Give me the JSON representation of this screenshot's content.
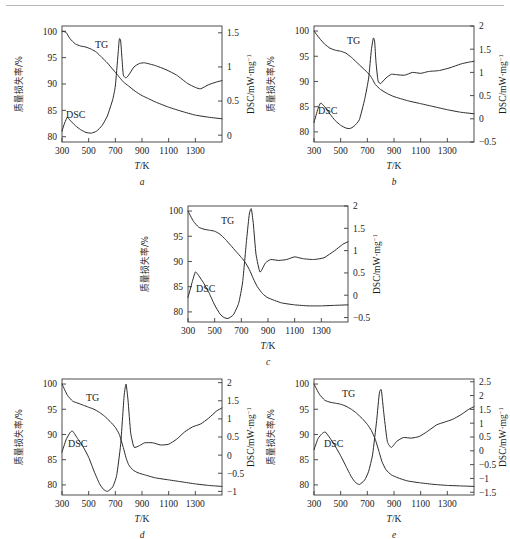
{
  "figure": {
    "axis_titles": {
      "x": "T/K",
      "y_left": "质量损失率/%",
      "y_right": "DSC/mW·mg⁻¹"
    },
    "x_ticks": [
      "300",
      "500",
      "700",
      "900",
      "1100",
      "1300"
    ],
    "y_left_ticks": [
      "80",
      "85",
      "90",
      "95",
      "100"
    ],
    "curve_labels": {
      "tg": "TG",
      "dsc": "DSC"
    }
  },
  "panels": [
    {
      "letter": "a",
      "right_ticks": [
        "0",
        "0.5",
        "1.0",
        "1.5"
      ],
      "tg_label": "TG",
      "dsc_label": "DSC"
    },
    {
      "letter": "b",
      "right_ticks": [
        "-0.5",
        "0",
        "0.5",
        "1.0",
        "1.5",
        "2.0"
      ],
      "tg_label": "TG",
      "dsc_label": "DSC"
    },
    {
      "letter": "c",
      "right_ticks": [
        "-0.5",
        "0",
        "0.5",
        "1.0",
        "1.5",
        "2.0"
      ],
      "tg_label": "TG",
      "dsc_label": "DSC"
    },
    {
      "letter": "d",
      "right_ticks": [
        "-1.0",
        "-0.5",
        "0",
        "0.5",
        "1.0",
        "1.5",
        "2.0"
      ],
      "tg_label": "TG",
      "dsc_label": "DSC"
    },
    {
      "letter": "e",
      "right_ticks": [
        "-1.5",
        "-1.0",
        "-0.5",
        "0",
        "0.5",
        "1.0",
        "1.5",
        "2.0",
        "2.5"
      ],
      "tg_label": "TG",
      "dsc_label": "DSC"
    }
  ],
  "chart_data": [
    {
      "type": "line",
      "title": "a",
      "xlabel": "T/K",
      "ylabel": "质量损失率/%",
      "y2label": "DSC/mW·mg⁻¹",
      "xlim": [
        300,
        1500
      ],
      "ylim": [
        79,
        101
      ],
      "y2lim": [
        -0.1,
        1.6
      ],
      "xticks": [
        300,
        500,
        700,
        900,
        1100,
        1300
      ],
      "yticks": [
        80,
        85,
        90,
        95,
        100
      ],
      "y2ticks": [
        0,
        0.5,
        1.0,
        1.5
      ],
      "grid": false,
      "series": [
        {
          "name": "TG",
          "axis": "left",
          "x": [
            300,
            330,
            360,
            400,
            440,
            480,
            520,
            560,
            600,
            640,
            680,
            700,
            720,
            740,
            760,
            800,
            850,
            900,
            950,
            1000,
            1100,
            1200,
            1300,
            1400,
            1500
          ],
          "values": [
            100.0,
            99.8,
            98.6,
            97.6,
            97.2,
            97.0,
            96.6,
            96.0,
            95.0,
            94.0,
            92.8,
            92.2,
            91.6,
            91.0,
            90.4,
            89.6,
            88.6,
            87.8,
            87.2,
            86.6,
            85.6,
            84.8,
            84.1,
            83.7,
            83.4
          ]
        },
        {
          "name": "DSC",
          "axis": "right",
          "x": [
            300,
            320,
            340,
            360,
            400,
            440,
            480,
            520,
            560,
            600,
            640,
            680,
            700,
            720,
            730,
            740,
            750,
            760,
            780,
            800,
            840,
            880,
            920,
            1000,
            1080,
            1160,
            1240,
            1300,
            1340,
            1400,
            1460,
            1500
          ],
          "values": [
            0.06,
            0.18,
            0.26,
            0.22,
            0.14,
            0.08,
            0.04,
            0.03,
            0.06,
            0.14,
            0.28,
            0.52,
            0.72,
            1.18,
            1.41,
            1.38,
            1.12,
            0.88,
            0.84,
            0.88,
            1.0,
            1.05,
            1.06,
            1.02,
            0.96,
            0.88,
            0.76,
            0.7,
            0.68,
            0.74,
            0.78,
            0.8
          ]
        }
      ]
    },
    {
      "type": "line",
      "title": "b",
      "xlabel": "T/K",
      "ylabel": "质量损失率/%",
      "y2label": "DSC/mW·mg⁻¹",
      "xlim": [
        300,
        1500
      ],
      "ylim": [
        78,
        101
      ],
      "y2lim": [
        -0.5,
        2.0
      ],
      "xticks": [
        300,
        500,
        700,
        900,
        1100,
        1300
      ],
      "yticks": [
        80,
        85,
        90,
        95,
        100
      ],
      "y2ticks": [
        -0.5,
        0,
        0.5,
        1.0,
        1.5,
        2.0
      ],
      "grid": false,
      "series": [
        {
          "name": "TG",
          "axis": "left",
          "x": [
            300,
            340,
            380,
            420,
            460,
            500,
            540,
            580,
            620,
            660,
            700,
            720,
            740,
            760,
            800,
            850,
            900,
            1000,
            1100,
            1200,
            1300,
            1400,
            1500
          ],
          "values": [
            100.0,
            98.6,
            97.4,
            96.6,
            96.2,
            96.0,
            95.6,
            94.8,
            93.8,
            92.8,
            91.8,
            91.2,
            90.4,
            89.4,
            88.4,
            87.6,
            87.0,
            86.2,
            85.6,
            85.0,
            84.4,
            83.9,
            83.6
          ]
        },
        {
          "name": "DSC",
          "axis": "right",
          "x": [
            300,
            330,
            350,
            380,
            420,
            460,
            500,
            540,
            570,
            600,
            640,
            680,
            710,
            730,
            745,
            755,
            765,
            780,
            800,
            840,
            880,
            920,
            980,
            1040,
            1100,
            1160,
            1240,
            1320,
            1400,
            1460,
            1500
          ],
          "values": [
            -0.08,
            0.22,
            0.34,
            0.26,
            0.1,
            -0.04,
            -0.14,
            -0.2,
            -0.21,
            -0.16,
            -0.02,
            0.42,
            0.88,
            1.48,
            1.74,
            1.66,
            1.22,
            0.82,
            0.76,
            0.88,
            0.96,
            0.95,
            0.94,
            1.0,
            0.98,
            1.02,
            1.04,
            1.1,
            1.18,
            1.22,
            1.24
          ]
        }
      ]
    },
    {
      "type": "line",
      "title": "c",
      "xlabel": "T/K",
      "ylabel": "质量损失率/%",
      "y2label": "DSC/mW·mg⁻¹",
      "xlim": [
        300,
        1500
      ],
      "ylim": [
        78,
        101
      ],
      "y2lim": [
        -0.6,
        2.0
      ],
      "xticks": [
        300,
        500,
        700,
        900,
        1100,
        1300
      ],
      "yticks": [
        80,
        85,
        90,
        95,
        100
      ],
      "y2ticks": [
        -0.5,
        0,
        0.5,
        1.0,
        1.5,
        2.0
      ],
      "grid": false,
      "series": [
        {
          "name": "TG",
          "axis": "left",
          "x": [
            300,
            340,
            380,
            420,
            460,
            500,
            540,
            580,
            620,
            660,
            700,
            730,
            760,
            790,
            820,
            860,
            900,
            1000,
            1100,
            1200,
            1300,
            1400,
            1500
          ],
          "values": [
            100.0,
            98.0,
            96.8,
            96.4,
            96.2,
            96.0,
            95.4,
            94.4,
            93.2,
            92.0,
            90.8,
            89.8,
            88.4,
            86.6,
            85.0,
            83.6,
            82.8,
            81.8,
            81.4,
            81.2,
            81.2,
            81.3,
            81.4
          ]
        },
        {
          "name": "DSC",
          "axis": "right",
          "x": [
            300,
            330,
            355,
            380,
            420,
            460,
            500,
            540,
            570,
            600,
            640,
            680,
            710,
            740,
            760,
            775,
            790,
            810,
            840,
            880,
            920,
            980,
            1040,
            1100,
            1160,
            1240,
            1320,
            1400,
            1460,
            1500
          ],
          "values": [
            -0.05,
            0.28,
            0.52,
            0.44,
            0.26,
            0.04,
            -0.22,
            -0.42,
            -0.5,
            -0.52,
            -0.44,
            -0.18,
            0.3,
            1.26,
            1.82,
            1.94,
            1.6,
            0.92,
            0.52,
            0.72,
            0.8,
            0.78,
            0.8,
            0.86,
            0.82,
            0.8,
            0.84,
            1.0,
            1.14,
            1.2
          ]
        }
      ]
    },
    {
      "type": "line",
      "title": "d",
      "xlabel": "T/K",
      "ylabel": "质量损失率/%",
      "y2label": "DSC/mW·mg⁻¹",
      "xlim": [
        300,
        1500
      ],
      "ylim": [
        78,
        101
      ],
      "y2lim": [
        -1.1,
        2.1
      ],
      "xticks": [
        300,
        500,
        700,
        900,
        1100,
        1300
      ],
      "yticks": [
        80,
        85,
        90,
        95,
        100
      ],
      "y2ticks": [
        -1.0,
        -0.5,
        0,
        0.5,
        1.0,
        1.5,
        2.0
      ],
      "grid": false,
      "series": [
        {
          "name": "TG",
          "axis": "left",
          "x": [
            300,
            340,
            380,
            420,
            460,
            500,
            540,
            580,
            620,
            660,
            700,
            730,
            760,
            780,
            800,
            830,
            870,
            920,
            1000,
            1100,
            1200,
            1300,
            1400,
            1500
          ],
          "values": [
            100.0,
            97.8,
            96.6,
            96.2,
            95.8,
            95.4,
            95.0,
            94.4,
            93.6,
            92.6,
            91.4,
            90.0,
            87.4,
            85.4,
            84.0,
            83.0,
            82.4,
            82.0,
            81.4,
            81.0,
            80.6,
            80.2,
            79.9,
            79.7
          ]
        },
        {
          "name": "DSC",
          "axis": "right",
          "x": [
            300,
            330,
            360,
            380,
            420,
            460,
            500,
            540,
            580,
            610,
            640,
            680,
            710,
            740,
            765,
            780,
            795,
            815,
            840,
            880,
            920,
            980,
            1040,
            1100,
            1160,
            1220,
            1280,
            1340,
            1400,
            1460,
            1500
          ],
          "values": [
            0.08,
            0.42,
            0.62,
            0.66,
            0.44,
            0.22,
            -0.06,
            -0.44,
            -0.78,
            -0.94,
            -1.0,
            -0.88,
            -0.56,
            0.3,
            1.6,
            1.96,
            1.52,
            0.62,
            0.22,
            0.26,
            0.34,
            0.34,
            0.28,
            0.3,
            0.44,
            0.64,
            0.78,
            0.86,
            1.02,
            1.22,
            1.3
          ]
        }
      ]
    },
    {
      "type": "line",
      "title": "e",
      "xlabel": "T/K",
      "ylabel": "质量损失率/%",
      "y2label": "DSC/mW·mg⁻¹",
      "xlim": [
        300,
        1500
      ],
      "ylim": [
        78,
        101
      ],
      "y2lim": [
        -1.6,
        2.6
      ],
      "xticks": [
        300,
        500,
        700,
        900,
        1100,
        1300
      ],
      "yticks": [
        80,
        85,
        90,
        95,
        100
      ],
      "y2ticks": [
        -1.5,
        -1.0,
        -0.5,
        0,
        0.5,
        1.0,
        1.5,
        2.0,
        2.5
      ],
      "grid": false,
      "series": [
        {
          "name": "TG",
          "axis": "left",
          "x": [
            300,
            340,
            380,
            420,
            460,
            500,
            540,
            580,
            620,
            660,
            700,
            730,
            760,
            790,
            810,
            840,
            880,
            930,
            1000,
            1100,
            1200,
            1300,
            1400,
            1500
          ],
          "values": [
            100.0,
            98.0,
            96.8,
            96.4,
            96.2,
            96.0,
            95.6,
            95.0,
            94.2,
            93.2,
            92.0,
            90.8,
            89.0,
            86.4,
            84.6,
            83.0,
            82.0,
            81.4,
            80.8,
            80.4,
            80.1,
            79.9,
            79.8,
            79.7
          ]
        },
        {
          "name": "DSC",
          "axis": "right",
          "x": [
            300,
            330,
            360,
            385,
            420,
            460,
            500,
            540,
            580,
            610,
            640,
            680,
            710,
            740,
            770,
            790,
            805,
            825,
            850,
            880,
            920,
            970,
            1030,
            1090,
            1150,
            1220,
            1280,
            1340,
            1400,
            1460,
            1500
          ],
          "values": [
            0.04,
            0.44,
            0.62,
            0.68,
            0.46,
            0.16,
            -0.18,
            -0.56,
            -0.94,
            -1.14,
            -1.22,
            -1.06,
            -0.74,
            -0.12,
            1.1,
            2.08,
            2.2,
            1.3,
            0.34,
            0.12,
            0.34,
            0.48,
            0.46,
            0.52,
            0.7,
            0.94,
            1.04,
            1.14,
            1.3,
            1.5,
            1.6
          ]
        }
      ]
    }
  ]
}
